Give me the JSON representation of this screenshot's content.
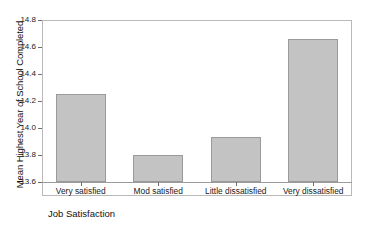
{
  "chart_data": {
    "type": "bar",
    "title": "",
    "subtitle": "",
    "xlabel": "Job Satisfaction",
    "ylabel": "Mean Highest Year of School Completed",
    "categories": [
      "Very satisfied",
      "Mod satisfied",
      "Little dissatisfied",
      "Very dissatisfied"
    ],
    "values": [
      14.25,
      13.8,
      13.93,
      14.66
    ],
    "ylim": [
      13.6,
      14.8
    ],
    "ytick_labels": [
      "14.8",
      "14.6",
      "14.4",
      "14.2",
      "14.0",
      "13.8",
      "13.6"
    ],
    "ytick_values": [
      14.8,
      14.6,
      14.4,
      14.2,
      14.0,
      13.8,
      13.6
    ],
    "ytick_step": 0.2,
    "grid": false,
    "legend": false,
    "legend_position": "none",
    "bar_fill_color": "#c3c3c3",
    "bar_edge_color": "#9a9a9a",
    "frame_color": "#b9b9b9",
    "background_color": "#ffffff",
    "text_color": "#1a1a1a"
  },
  "figure": {
    "background": "#ffffff"
  }
}
